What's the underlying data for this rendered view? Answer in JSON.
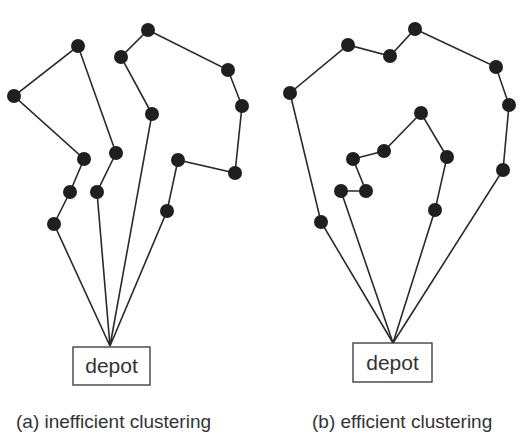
{
  "panels": [
    {
      "id": "a",
      "caption": "(a) inefficient clustering",
      "depot": {
        "label": "depot",
        "box": [
          73,
          347,
          77,
          38
        ],
        "apex": [
          110,
          346
        ]
      },
      "caption_pos": [
        16,
        428
      ],
      "routes": [
        [
          [
            110,
            346
          ],
          [
            54,
            224
          ],
          [
            70,
            192
          ],
          [
            84,
            159
          ],
          [
            14,
            96
          ],
          [
            78,
            46
          ],
          [
            116,
            153
          ],
          [
            97,
            192
          ],
          [
            110,
            346
          ]
        ],
        [
          [
            110,
            346
          ],
          [
            152,
            114
          ],
          [
            121,
            57
          ],
          [
            148,
            30
          ],
          [
            228,
            70
          ],
          [
            242,
            106
          ],
          [
            235,
            173
          ],
          [
            178,
            160
          ],
          [
            167,
            211
          ],
          [
            110,
            346
          ]
        ]
      ],
      "nodes": [
        [
          78,
          46
        ],
        [
          14,
          96
        ],
        [
          84,
          159
        ],
        [
          70,
          192
        ],
        [
          54,
          224
        ],
        [
          116,
          153
        ],
        [
          97,
          192
        ],
        [
          148,
          30
        ],
        [
          121,
          57
        ],
        [
          152,
          114
        ],
        [
          228,
          70
        ],
        [
          242,
          106
        ],
        [
          235,
          173
        ],
        [
          178,
          160
        ],
        [
          167,
          211
        ]
      ]
    },
    {
      "id": "b",
      "caption": "(b) efficient clustering",
      "depot": {
        "label": "depot",
        "box": [
          353,
          343,
          79,
          39
        ],
        "apex": [
          393,
          343
        ]
      },
      "caption_pos": [
        312,
        428
      ],
      "routes": [
        [
          [
            393,
            343
          ],
          [
            321,
            222
          ],
          [
            290,
            93
          ],
          [
            348,
            45
          ],
          [
            390,
            56
          ],
          [
            415,
            29
          ],
          [
            496,
            67
          ],
          [
            509,
            105
          ],
          [
            503,
            170
          ],
          [
            393,
            343
          ]
        ],
        [
          [
            393,
            343
          ],
          [
            341,
            191
          ],
          [
            366,
            191
          ],
          [
            353,
            159
          ],
          [
            384,
            151
          ],
          [
            421,
            113
          ],
          [
            447,
            157
          ],
          [
            435,
            210
          ],
          [
            393,
            343
          ]
        ]
      ],
      "nodes": [
        [
          290,
          93
        ],
        [
          348,
          45
        ],
        [
          390,
          56
        ],
        [
          415,
          29
        ],
        [
          496,
          67
        ],
        [
          509,
          105
        ],
        [
          503,
          170
        ],
        [
          321,
          222
        ],
        [
          341,
          191
        ],
        [
          366,
          191
        ],
        [
          353,
          159
        ],
        [
          384,
          151
        ],
        [
          421,
          113
        ],
        [
          447,
          157
        ],
        [
          435,
          210
        ]
      ]
    }
  ],
  "colors": {
    "node": "#1f1f1f",
    "edge": "#2a2a2a",
    "text": "#333333"
  }
}
